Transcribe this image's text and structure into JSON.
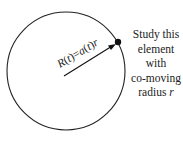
{
  "diagram": {
    "circle": {
      "cx": 66,
      "cy": 71,
      "r": 59,
      "stroke": "#222222"
    },
    "arrow": {
      "x1": 64,
      "y1": 76,
      "x2": 116,
      "y2": 44
    },
    "element_dot": {
      "cx": 118,
      "cy": 42,
      "r": 3.2
    },
    "arrow_label": {
      "R": "R",
      "t1": "t",
      "eq": "=",
      "a": "a",
      "t2": "t",
      "r": "r"
    },
    "side_text": {
      "line1": "Study this",
      "line2": "element",
      "line3": "with",
      "line4": "co-moving",
      "line5_prefix": "radius ",
      "line5_var": "r"
    }
  }
}
